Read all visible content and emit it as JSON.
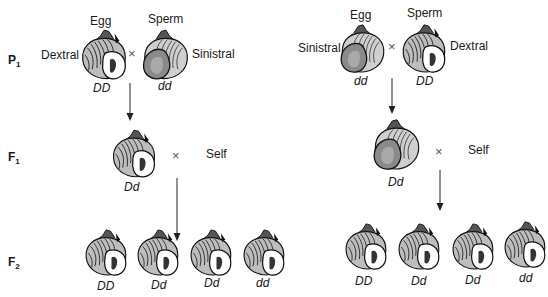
{
  "generations": {
    "p1": {
      "label": "P",
      "sub": "1"
    },
    "f1": {
      "label": "F",
      "sub": "1"
    },
    "f2": {
      "label": "F",
      "sub": "2"
    }
  },
  "symbols": {
    "cross": "×"
  },
  "left_cross": {
    "p1": {
      "egg": {
        "role": "Egg",
        "phenotype": "Dextral",
        "genotype": "DD",
        "coiling": "dextral"
      },
      "sperm": {
        "role": "Sperm",
        "phenotype": "Sinistral",
        "genotype": "dd",
        "coiling": "sinistral"
      }
    },
    "f1": {
      "genotype": "Dd",
      "coiling": "dextral",
      "mate": "Self"
    },
    "f2": [
      {
        "genotype": "DD",
        "coiling": "dextral"
      },
      {
        "genotype": "Dd",
        "coiling": "dextral"
      },
      {
        "genotype": "Dd",
        "coiling": "dextral"
      },
      {
        "genotype": "dd",
        "coiling": "dextral"
      }
    ]
  },
  "right_cross": {
    "p1": {
      "egg": {
        "role": "Egg",
        "phenotype": "Sinistral",
        "genotype": "dd",
        "coiling": "sinistral"
      },
      "sperm": {
        "role": "Sperm",
        "phenotype": "Dextral",
        "genotype": "DD",
        "coiling": "dextral"
      }
    },
    "f1": {
      "genotype": "Dd",
      "coiling": "sinistral",
      "mate": "Self"
    },
    "f2": [
      {
        "genotype": "DD",
        "coiling": "dextral"
      },
      {
        "genotype": "Dd",
        "coiling": "dextral"
      },
      {
        "genotype": "Dd",
        "coiling": "dextral"
      },
      {
        "genotype": "dd",
        "coiling": "dextral"
      }
    ]
  },
  "colors": {
    "ink": "#1a1a1a",
    "sinistral_fill": "#8a8a8a",
    "dextral_fill": "#d8d8d8",
    "background": "#ffffff"
  }
}
